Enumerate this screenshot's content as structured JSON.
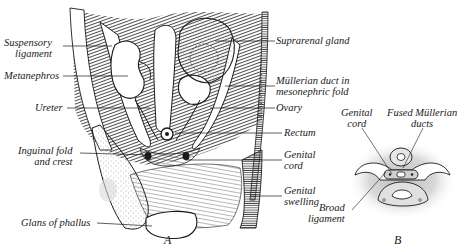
{
  "figure": {
    "panels": [
      {
        "id": "A",
        "label": "A"
      },
      {
        "id": "B",
        "label": "B"
      }
    ],
    "panel_a_labels_left": {
      "suspensory_ligament": [
        "Suspensory",
        "ligament"
      ],
      "metanephros": "Metanephros",
      "ureter": "Ureter",
      "inguinal_fold": [
        "Inguinal fold",
        "and crest"
      ],
      "glans_of_phallus": "Glans of phallus"
    },
    "panel_a_labels_right": {
      "suprarenal_gland": "Suprarenal gland",
      "mullerian_duct": [
        "Müllerian duct in",
        "mesonephric fold"
      ],
      "ovary": "Ovary",
      "rectum": "Rectum",
      "genital_cord": [
        "Genital",
        "cord"
      ],
      "genital_swelling": [
        "Genital",
        "swelling"
      ]
    },
    "panel_b_labels": {
      "genital_cord": [
        "Genital",
        "cord"
      ],
      "fused_mullerian_ducts": [
        "Fused Müllerian",
        "ducts"
      ],
      "broad_ligament": [
        "Broad",
        "ligament"
      ]
    },
    "colors": {
      "ink": "#1a1a1a",
      "shade": "#3a3a3a",
      "stipple": "#9a9a9a",
      "background": "#ffffff"
    }
  }
}
